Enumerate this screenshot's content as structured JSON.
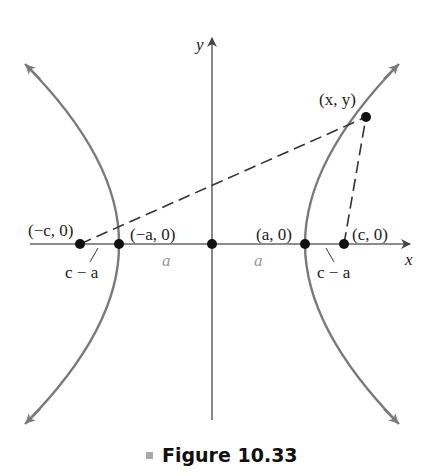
{
  "figure": {
    "caption_label": "Figure 10.33",
    "caption_marker_color": "#a8a8a8",
    "curve_color": "#7a7a7a",
    "axis_color": "#555555"
  },
  "axes": {
    "x_label": "x",
    "y_label": "y"
  },
  "points": {
    "neg_c": "(−c, 0)",
    "neg_a": "(−a, 0)",
    "pos_a": "(a, 0)",
    "pos_c": "(c, 0)",
    "xy": "(x, y)"
  },
  "distances": {
    "left_c_minus_a": "c − a",
    "right_c_minus_a": "c − a",
    "left_a": "a",
    "right_a": "a"
  }
}
